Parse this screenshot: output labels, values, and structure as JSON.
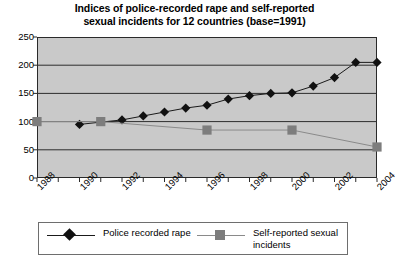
{
  "chart_data": {
    "type": "line",
    "title": "Indices of police-recorded rape and self-reported sexual incidents for 12 countries (base=1991)",
    "title_line1": "Indices of police-recorded rape and self-reported",
    "title_line2": "sexual incidents for 12 countries (base=1991)",
    "xlabel": "",
    "ylabel": "",
    "ylim": [
      0,
      250
    ],
    "yticks": [
      0,
      50,
      100,
      150,
      200,
      250
    ],
    "ytick_labels": [
      "0",
      "50",
      "100",
      "150",
      "200",
      "250"
    ],
    "xlim": [
      1988,
      2004
    ],
    "xticks": [
      1988,
      1989,
      1990,
      1991,
      1992,
      1993,
      1994,
      1995,
      1996,
      1997,
      1998,
      1999,
      2000,
      2001,
      2002,
      2003,
      2004
    ],
    "xtick_labels": [
      "1988",
      "1990",
      "1992",
      "1994",
      "1996",
      "1998",
      "2000",
      "2002",
      "2004"
    ],
    "xtick_labeled_years": [
      1988,
      1990,
      1992,
      1994,
      1996,
      1998,
      2000,
      2002,
      2004
    ],
    "grid": true,
    "grid_axis": "y",
    "legend_position": "bottom",
    "series": [
      {
        "name": "Police recorded rape",
        "marker": "diamond",
        "color": "#111111",
        "line_color": "#1a1a1a",
        "x": [
          1990,
          1992,
          1993,
          1994,
          1995,
          1996,
          1997,
          1998,
          1999,
          2000,
          2001,
          2002,
          2003,
          2004
        ],
        "values": [
          95,
          103,
          110,
          117,
          124,
          129,
          140,
          146,
          150,
          151,
          163,
          178,
          205,
          205
        ]
      },
      {
        "name": "Self-reported sexual incidents",
        "marker": "square",
        "color": "#7d7d7d",
        "line_color": "#8a8a8a",
        "x": [
          1988,
          1991,
          1996,
          2000,
          2004
        ],
        "values": [
          100,
          100,
          85,
          85,
          55
        ]
      }
    ]
  },
  "legend": {
    "entries": [
      {
        "label_line1": "Police recorded",
        "label_line2": "rape",
        "marker": "diamond"
      },
      {
        "label_line1": "Self-reported sexual",
        "label_line2": "incidents",
        "marker": "square"
      }
    ]
  },
  "colors": {
    "plot_background": "#c9c9c9",
    "axis": "#2a2a2a",
    "gridline": "#2d2d2d",
    "series_primary": "#111111",
    "series_secondary": "#7d7d7d",
    "page_background": "#ffffff"
  }
}
